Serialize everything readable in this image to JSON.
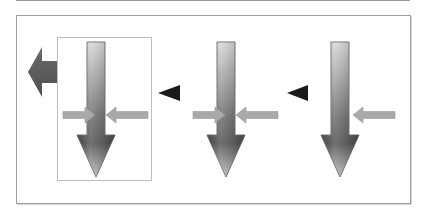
{
  "diagram": {
    "colors": {
      "frame": "#9e9e9e",
      "highlight_box": "#bdbdbd",
      "vertical_arrow_light": "#d4d4d4",
      "vertical_arrow_dark": "#5a5a5a",
      "horizontal_arrow": "#a8a8a8",
      "left_arrow": "#5f5f5f",
      "pointer": "#1a1a1a"
    },
    "stages": [
      {
        "id": "stage-1",
        "highlighted": true,
        "inward_arrows": [
          "left",
          "right"
        ],
        "output_arrow": "left"
      },
      {
        "id": "stage-2",
        "highlighted": false,
        "inward_arrows": [
          "left",
          "right"
        ]
      },
      {
        "id": "stage-3",
        "highlighted": false,
        "inward_arrows": [
          "right"
        ]
      }
    ],
    "pointers": [
      {
        "between": [
          "stage-1",
          "stage-2"
        ],
        "direction": "left"
      },
      {
        "between": [
          "stage-2",
          "stage-3"
        ],
        "direction": "left"
      }
    ]
  }
}
